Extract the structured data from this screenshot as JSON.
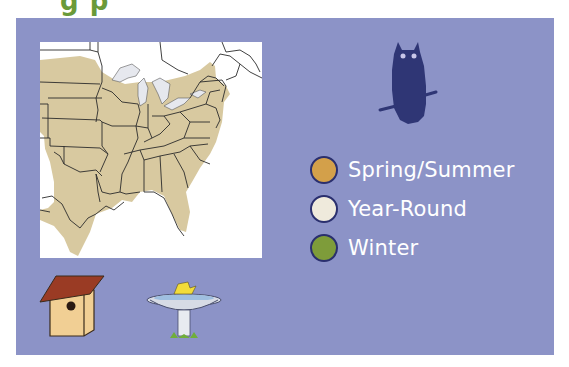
{
  "title": {
    "text_fragment": "g p",
    "color": "#6a9a3a"
  },
  "panel": {
    "background": "#8c93c7"
  },
  "map": {
    "region": "Eastern United States",
    "range_color": "#d8c9a0",
    "water_color": "#e6e8ee",
    "border_color": "#2b2b2b",
    "background": "#ffffff"
  },
  "owl_icon": {
    "color": "#2f3675",
    "eye_color": "#c8c6e8"
  },
  "legend": {
    "items": [
      {
        "label": "Spring/Summer",
        "color": "#d3a04a"
      },
      {
        "label": "Year-Round",
        "color": "#efeadc"
      },
      {
        "label": "Winter",
        "color": "#7e9c3a"
      }
    ]
  },
  "icons": {
    "birdhouse": {
      "roof_color": "#9a3b24",
      "body_color": "#f1cf94"
    },
    "birdbath": {
      "basin_color": "#d7dbe5",
      "water_color": "#9fbfe0",
      "bird_color": "#f2dc3a",
      "grass_color": "#6fae3a"
    }
  }
}
